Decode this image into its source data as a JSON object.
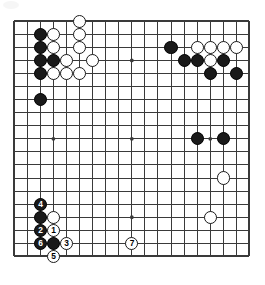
{
  "figure": {
    "kind": "go-board-diagram",
    "board_size": 19,
    "title": "",
    "colors": {
      "board_background": "#ffffff",
      "grid_line": "#3a3a3a",
      "border_line": "#2b2b2b",
      "black_stone": "#1a1a1a",
      "white_stone": "#ffffff",
      "white_stone_edge": "#1a1a1a",
      "black_label_text": "#ffffff",
      "white_label_text": "#000000"
    },
    "geometry": {
      "origin_x": 14.2,
      "origin_y": 21.2,
      "spacing": 13.07,
      "stone_diameter": 13.2,
      "line_width": 1,
      "border_width": 2,
      "star_point_radius": 1.9
    },
    "star_points": [
      {
        "col": 4,
        "row": 4
      },
      {
        "col": 10,
        "row": 4
      },
      {
        "col": 16,
        "row": 4
      },
      {
        "col": 4,
        "row": 10
      },
      {
        "col": 10,
        "row": 10
      },
      {
        "col": 16,
        "row": 10
      },
      {
        "col": 4,
        "row": 16
      },
      {
        "col": 10,
        "row": 16
      },
      {
        "col": 16,
        "row": 16
      }
    ],
    "stones": [
      {
        "col": 6,
        "row": 1,
        "color": "white",
        "label": ""
      },
      {
        "col": 3,
        "row": 2,
        "color": "black",
        "label": ""
      },
      {
        "col": 4,
        "row": 2,
        "color": "white",
        "label": ""
      },
      {
        "col": 6,
        "row": 2,
        "color": "white",
        "label": ""
      },
      {
        "col": 3,
        "row": 3,
        "color": "black",
        "label": ""
      },
      {
        "col": 4,
        "row": 3,
        "color": "white",
        "label": ""
      },
      {
        "col": 6,
        "row": 3,
        "color": "white",
        "label": ""
      },
      {
        "col": 13,
        "row": 3,
        "color": "black",
        "label": ""
      },
      {
        "col": 15,
        "row": 3,
        "color": "white",
        "label": ""
      },
      {
        "col": 16,
        "row": 3,
        "color": "white",
        "label": ""
      },
      {
        "col": 17,
        "row": 3,
        "color": "white",
        "label": ""
      },
      {
        "col": 18,
        "row": 3,
        "color": "white",
        "label": ""
      },
      {
        "col": 3,
        "row": 4,
        "color": "black",
        "label": ""
      },
      {
        "col": 4,
        "row": 4,
        "color": "black",
        "label": ""
      },
      {
        "col": 5,
        "row": 4,
        "color": "white",
        "label": ""
      },
      {
        "col": 7,
        "row": 4,
        "color": "white",
        "label": ""
      },
      {
        "col": 14,
        "row": 4,
        "color": "black",
        "label": ""
      },
      {
        "col": 15,
        "row": 4,
        "color": "black",
        "label": ""
      },
      {
        "col": 16,
        "row": 4,
        "color": "white",
        "label": ""
      },
      {
        "col": 17,
        "row": 4,
        "color": "black",
        "label": ""
      },
      {
        "col": 3,
        "row": 5,
        "color": "black",
        "label": ""
      },
      {
        "col": 4,
        "row": 5,
        "color": "white",
        "label": ""
      },
      {
        "col": 5,
        "row": 5,
        "color": "white",
        "label": ""
      },
      {
        "col": 6,
        "row": 5,
        "color": "white",
        "label": ""
      },
      {
        "col": 16,
        "row": 5,
        "color": "black",
        "label": ""
      },
      {
        "col": 18,
        "row": 5,
        "color": "black",
        "label": ""
      },
      {
        "col": 3,
        "row": 7,
        "color": "black",
        "label": ""
      },
      {
        "col": 15,
        "row": 10,
        "color": "black",
        "label": ""
      },
      {
        "col": 17,
        "row": 10,
        "color": "black",
        "label": ""
      },
      {
        "col": 17,
        "row": 13,
        "color": "white",
        "label": ""
      },
      {
        "col": 3,
        "row": 15,
        "color": "black",
        "label": "4"
      },
      {
        "col": 3,
        "row": 16,
        "color": "black",
        "label": ""
      },
      {
        "col": 4,
        "row": 16,
        "color": "white",
        "label": ""
      },
      {
        "col": 16,
        "row": 16,
        "color": "white",
        "label": ""
      },
      {
        "col": 3,
        "row": 17,
        "color": "black",
        "label": "2"
      },
      {
        "col": 4,
        "row": 17,
        "color": "white",
        "label": "1"
      },
      {
        "col": 3,
        "row": 18,
        "color": "black",
        "label": "6"
      },
      {
        "col": 4,
        "row": 18,
        "color": "black",
        "label": ""
      },
      {
        "col": 5,
        "row": 18,
        "color": "white",
        "label": "3"
      },
      {
        "col": 10,
        "row": 18,
        "color": "white",
        "label": "7"
      },
      {
        "col": 4,
        "row": 19,
        "color": "white",
        "label": "5"
      }
    ],
    "move_sequence": [
      {
        "number": "1",
        "color": "white",
        "col": 4,
        "row": 17
      },
      {
        "number": "2",
        "color": "black",
        "col": 3,
        "row": 17
      },
      {
        "number": "3",
        "color": "white",
        "col": 5,
        "row": 18
      },
      {
        "number": "4",
        "color": "black",
        "col": 3,
        "row": 15
      },
      {
        "number": "5",
        "color": "white",
        "col": 4,
        "row": 19
      },
      {
        "number": "6",
        "color": "black",
        "col": 3,
        "row": 18
      },
      {
        "number": "7",
        "color": "white",
        "col": 10,
        "row": 18
      }
    ]
  }
}
